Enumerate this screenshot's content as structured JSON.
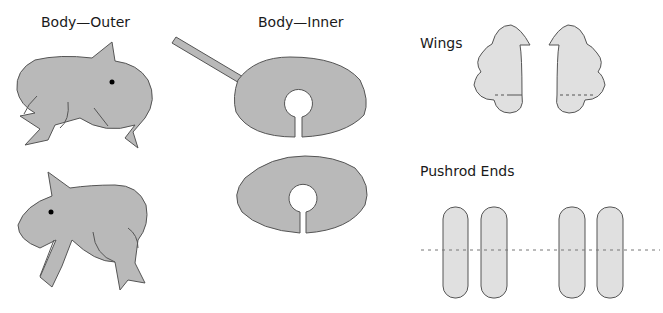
{
  "labels": {
    "body_outer": "Body—Outer",
    "body_inner": "Body—Inner",
    "wings": "Wings",
    "pushrod_ends": "Pushrod Ends"
  },
  "colors": {
    "body_fill": "#b9b9b9",
    "light_fill": "#e0e0e0",
    "stroke": "#555555"
  }
}
